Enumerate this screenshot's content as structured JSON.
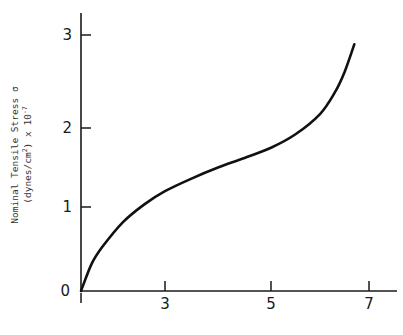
{
  "chart_data": {
    "type": "line",
    "title": "",
    "xlabel": "",
    "ylabel": "Nominal Tensile Stress σ (dynes/cm²) x 10⁻⁷",
    "ylabel_line1": "Nominal Tensile Stress σ",
    "ylabel_line2_prefix": "(dynes/cm",
    "ylabel_line2_sup": "2",
    "ylabel_line2_suffix": ") x 10",
    "ylabel_exp": "-7",
    "xlim": [
      1,
      7.6
    ],
    "ylim": [
      0,
      3.25
    ],
    "x_ticks": [
      "1",
      "3",
      "5",
      "7"
    ],
    "y_ticks": [
      "0",
      "1",
      "2",
      "3"
    ],
    "grid": false,
    "legend": null,
    "series": [
      {
        "name": "stress-strain",
        "x": [
          1.0,
          1.25,
          1.5,
          2.0,
          2.5,
          3.0,
          3.5,
          4.0,
          4.5,
          5.0,
          5.5,
          6.0,
          6.3,
          6.5,
          6.7
        ],
        "y": [
          0.0,
          0.32,
          0.52,
          0.82,
          1.03,
          1.2,
          1.36,
          1.5,
          1.62,
          1.75,
          1.92,
          2.15,
          2.38,
          2.6,
          2.9
        ]
      }
    ]
  }
}
